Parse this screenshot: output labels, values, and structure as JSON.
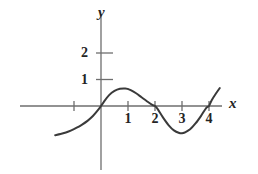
{
  "figure": {
    "background_color": "#ffffff",
    "stroke_color": "#3a3a3a",
    "axis_color": "#6e6e6e",
    "text_color": "#242424"
  },
  "axes": {
    "x_label": "x",
    "y_label": "y",
    "x_ticks": [
      {
        "value": -1,
        "label": ""
      },
      {
        "value": 1,
        "label": "1"
      },
      {
        "value": 2,
        "label": "2"
      },
      {
        "value": 3,
        "label": "3"
      },
      {
        "value": 4,
        "label": "4"
      }
    ],
    "y_ticks": [
      {
        "value": 1,
        "label": "1"
      },
      {
        "value": 2,
        "label": "2"
      }
    ]
  },
  "chart_data": {
    "type": "line",
    "title": "",
    "xlabel": "x",
    "ylabel": "y",
    "grid": false,
    "legend": null,
    "xlim": [
      -1.7,
      4.5
    ],
    "ylim": [
      -1.1,
      2.6
    ],
    "xticks": [
      -1,
      1,
      2,
      3,
      4
    ],
    "xticklabels": [
      "",
      "1",
      "2",
      "3",
      "4"
    ],
    "yticks": [
      1,
      2
    ],
    "yticklabels": [
      "1",
      "2"
    ],
    "annotations": [
      {
        "text": "local maximum near x = 1, y ≈ 0.65"
      },
      {
        "text": "local minimum near x = 3, y ≈ -1.0"
      },
      {
        "text": "x-intercepts at x = 0, x = 2, x = 4"
      }
    ],
    "series": [
      {
        "name": "curve",
        "x": [
          -1.7,
          -1.5,
          -1.3,
          -1.1,
          -0.9,
          -0.7,
          -0.5,
          -0.3,
          -0.1,
          0.0,
          0.1,
          0.3,
          0.5,
          0.7,
          0.9,
          1.0,
          1.1,
          1.3,
          1.5,
          1.7,
          1.9,
          2.0,
          2.1,
          2.3,
          2.5,
          2.7,
          2.9,
          3.0,
          3.1,
          3.3,
          3.5,
          3.7,
          3.9,
          4.0,
          4.1,
          4.25,
          4.4
        ],
        "y": [
          -1.1,
          -1.06,
          -1.0,
          -0.92,
          -0.82,
          -0.7,
          -0.56,
          -0.38,
          -0.14,
          0.0,
          0.15,
          0.41,
          0.57,
          0.65,
          0.66,
          0.64,
          0.6,
          0.48,
          0.33,
          0.18,
          0.04,
          0.0,
          -0.12,
          -0.44,
          -0.72,
          -0.92,
          -1.02,
          -1.03,
          -1.0,
          -0.88,
          -0.66,
          -0.38,
          -0.07,
          0.0,
          0.22,
          0.46,
          0.68
        ]
      }
    ]
  }
}
